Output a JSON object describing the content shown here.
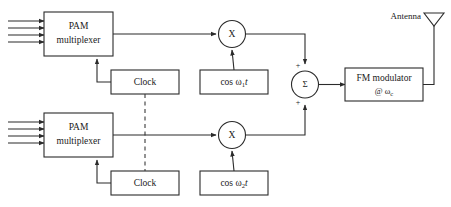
{
  "diagram": {
    "colors": {
      "background": "#ffffff",
      "stroke": "#2b2b2b",
      "text": "#1a1a1a",
      "dashed_stroke": "#3a3a3a"
    },
    "channels": [
      {
        "id": "upper",
        "pam": {
          "line1": "PAM",
          "line2": "multiplexer",
          "inputs": 4
        },
        "clock": {
          "label": "Clock"
        },
        "multiplier": {
          "label": "X"
        },
        "oscillator": {
          "prefix": "cos",
          "omega": "ω",
          "subscript": "1",
          "time": "t"
        },
        "sum_sign": "+"
      },
      {
        "id": "lower",
        "pam": {
          "line1": "PAM",
          "line2": "multiplexer",
          "inputs": 4
        },
        "clock": {
          "label": "Clock"
        },
        "multiplier": {
          "label": "X"
        },
        "oscillator": {
          "prefix": "cos",
          "omega": "ω",
          "subscript": "2",
          "time": "t"
        },
        "sum_sign": "+"
      }
    ],
    "summer": {
      "label": "Σ",
      "plus_top": "+",
      "plus_bottom": "+"
    },
    "modulator": {
      "line1": "FM modulator",
      "at": "@",
      "omega": "ω",
      "subscript": "c"
    },
    "antenna": {
      "label": "Antenna"
    }
  }
}
